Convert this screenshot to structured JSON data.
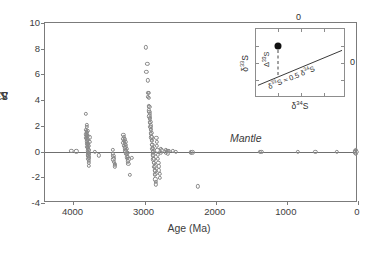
{
  "chart_data": {
    "type": "scatter",
    "title": "",
    "xlabel": "Age (Ma)",
    "ylabel": "Δ33S (per mil)",
    "ylabel_base": "Δ",
    "ylabel_sup": "33",
    "ylabel_tail": "S (per mil)",
    "xlim": [
      4400,
      0
    ],
    "ylim": [
      -4,
      10
    ],
    "x_reversed": true,
    "grid": false,
    "legend": "none",
    "xticks": [
      4000,
      3000,
      2000,
      1000,
      0
    ],
    "xtick_labels": [
      "4000",
      "3000",
      "2000",
      "1000",
      "0"
    ],
    "yticks": [
      -4,
      -2,
      0,
      2,
      4,
      6,
      8,
      10
    ],
    "ytick_labels": [
      "-4",
      "-2",
      "0",
      "2",
      "4",
      "6",
      "8",
      "10"
    ],
    "marker": "open-circle",
    "marker_color": "#8a8a8a",
    "zero_line": 0,
    "annotations": [
      {
        "name": "mantle-label",
        "text": "Mantle",
        "x": 1800,
        "y": 0.62,
        "style": "italic"
      }
    ],
    "points": [
      [
        4030,
        0.05
      ],
      [
        3960,
        0.02
      ],
      [
        3830,
        2.95
      ],
      [
        3830,
        1.7
      ],
      [
        3830,
        1.35
      ],
      [
        3830,
        1.05
      ],
      [
        3815,
        2.1
      ],
      [
        3815,
        1.55
      ],
      [
        3815,
        1.3
      ],
      [
        3815,
        0.95
      ],
      [
        3810,
        1.9
      ],
      [
        3810,
        1.45
      ],
      [
        3810,
        1.15
      ],
      [
        3810,
        0.8
      ],
      [
        3805,
        1.6
      ],
      [
        3805,
        1.25
      ],
      [
        3805,
        0.6
      ],
      [
        3805,
        0.35
      ],
      [
        3800,
        0.95
      ],
      [
        3800,
        0.55
      ],
      [
        3800,
        0.2
      ],
      [
        3800,
        -0.05
      ],
      [
        3795,
        0.7
      ],
      [
        3795,
        0.3
      ],
      [
        3795,
        -0.1
      ],
      [
        3795,
        -0.35
      ],
      [
        3790,
        0.45
      ],
      [
        3790,
        0.1
      ],
      [
        3790,
        -0.25
      ],
      [
        3790,
        -0.55
      ],
      [
        3785,
        0.15
      ],
      [
        3785,
        -0.2
      ],
      [
        3785,
        -0.45
      ],
      [
        3785,
        -0.7
      ],
      [
        3780,
        -0.15
      ],
      [
        3780,
        -0.4
      ],
      [
        3780,
        -0.85
      ],
      [
        3780,
        -1.1
      ],
      [
        3775,
        1.1
      ],
      [
        3775,
        0.75
      ],
      [
        3700,
        0.0
      ],
      [
        3640,
        -0.3
      ],
      [
        3450,
        0.15
      ],
      [
        3450,
        -0.2
      ],
      [
        3440,
        -0.35
      ],
      [
        3440,
        -0.6
      ],
      [
        3430,
        -0.5
      ],
      [
        3430,
        -0.8
      ],
      [
        3420,
        -0.95
      ],
      [
        3420,
        -1.15
      ],
      [
        3415,
        -1.05
      ],
      [
        3300,
        1.3
      ],
      [
        3300,
        1.0
      ],
      [
        3300,
        0.7
      ],
      [
        3290,
        1.15
      ],
      [
        3290,
        0.85
      ],
      [
        3290,
        0.45
      ],
      [
        3280,
        0.95
      ],
      [
        3280,
        0.6
      ],
      [
        3280,
        0.25
      ],
      [
        3270,
        0.75
      ],
      [
        3270,
        0.35
      ],
      [
        3270,
        0.05
      ],
      [
        3260,
        0.5
      ],
      [
        3260,
        0.15
      ],
      [
        3260,
        -0.2
      ],
      [
        3250,
        0.2
      ],
      [
        3250,
        -0.15
      ],
      [
        3250,
        -0.45
      ],
      [
        3240,
        -0.1
      ],
      [
        3240,
        -0.4
      ],
      [
        3240,
        -0.75
      ],
      [
        3230,
        -0.6
      ],
      [
        3230,
        -0.95
      ],
      [
        3210,
        -1.8
      ],
      [
        3180,
        -0.5
      ],
      [
        2980,
        8.1
      ],
      [
        2975,
        6.2
      ],
      [
        2960,
        6.85
      ],
      [
        2955,
        5.55
      ],
      [
        2950,
        4.55
      ],
      [
        2950,
        4.25
      ],
      [
        2945,
        4.55
      ],
      [
        2945,
        4.2
      ],
      [
        2940,
        3.55
      ],
      [
        2940,
        3.2
      ],
      [
        2935,
        3.5
      ],
      [
        2935,
        3.1
      ],
      [
        2935,
        2.75
      ],
      [
        2930,
        2.95
      ],
      [
        2930,
        2.55
      ],
      [
        2925,
        2.6
      ],
      [
        2925,
        2.25
      ],
      [
        2920,
        2.3
      ],
      [
        2920,
        1.95
      ],
      [
        2915,
        2.05
      ],
      [
        2915,
        1.7
      ],
      [
        2910,
        1.75
      ],
      [
        2910,
        1.4
      ],
      [
        2905,
        1.45
      ],
      [
        2905,
        1.1
      ],
      [
        2900,
        1.15
      ],
      [
        2900,
        0.85
      ],
      [
        2895,
        0.9
      ],
      [
        2895,
        0.55
      ],
      [
        2890,
        0.55
      ],
      [
        2890,
        0.2
      ],
      [
        2885,
        0.3
      ],
      [
        2885,
        -0.05
      ],
      [
        2880,
        0.05
      ],
      [
        2880,
        -0.3
      ],
      [
        2875,
        -0.25
      ],
      [
        2875,
        -0.6
      ],
      [
        2870,
        -0.55
      ],
      [
        2870,
        -0.9
      ],
      [
        2865,
        -0.85
      ],
      [
        2865,
        -1.2
      ],
      [
        2860,
        -1.15
      ],
      [
        2860,
        -1.5
      ],
      [
        2855,
        -1.45
      ],
      [
        2855,
        -1.8
      ],
      [
        2850,
        -1.75
      ],
      [
        2850,
        -2.15
      ],
      [
        2845,
        -2.35
      ],
      [
        2840,
        -2.55
      ],
      [
        2835,
        1.05
      ],
      [
        2830,
        0.75
      ],
      [
        2825,
        0.45
      ],
      [
        2820,
        0.1
      ],
      [
        2815,
        -0.25
      ],
      [
        2810,
        -0.55
      ],
      [
        2805,
        -0.85
      ],
      [
        2800,
        -1.15
      ],
      [
        2795,
        -1.45
      ],
      [
        2790,
        -1.75
      ],
      [
        2785,
        -2.05
      ],
      [
        2770,
        0.2
      ],
      [
        2770,
        -0.1
      ],
      [
        2760,
        0.1
      ],
      [
        2700,
        0.12
      ],
      [
        2700,
        -0.12
      ],
      [
        2690,
        0.08
      ],
      [
        2670,
        0.05
      ],
      [
        2670,
        -0.15
      ],
      [
        2660,
        0.05
      ],
      [
        2600,
        0.05
      ],
      [
        2560,
        0.0
      ],
      [
        2350,
        -0.05
      ],
      [
        2330,
        -0.05
      ],
      [
        2250,
        -2.7
      ],
      [
        1380,
        0.0
      ],
      [
        1360,
        0.0
      ],
      [
        850,
        0.0
      ],
      [
        600,
        0.0
      ],
      [
        300,
        0.0
      ],
      [
        40,
        0.05
      ],
      [
        40,
        -0.05
      ],
      [
        30,
        0.15
      ],
      [
        30,
        -0.15
      ],
      [
        20,
        0.0
      ]
    ]
  },
  "inset": {
    "name": "sulfur-isotope-inset",
    "x_title_base": "δ",
    "x_title_sup": "34",
    "x_title_tail": "S",
    "y_title_base": "δ",
    "y_title_sup": "33",
    "y_title_tail": "S",
    "top_zero": "0",
    "right_zero": "0",
    "delta_label_base": "Δ",
    "delta_label_sup": "33",
    "delta_label_tail": "S",
    "slope_label": "δ33S ≈ 0.5 δ34S",
    "slope_label_parts": [
      "δ",
      "33",
      "S ≈ 0.5 ",
      "δ",
      "34",
      "S"
    ],
    "point_marker": "filled-circle",
    "point_color": "#111111",
    "mass_dependent_line": "δ33S = 0.5 δ34S"
  }
}
